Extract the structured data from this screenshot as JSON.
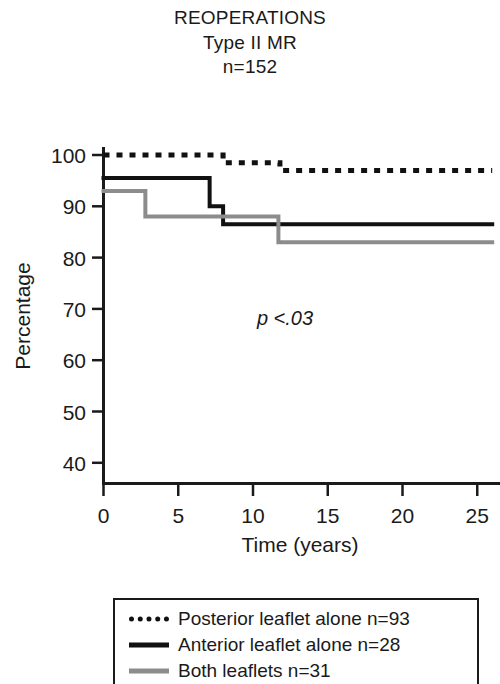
{
  "title": {
    "line1": "REOPERATIONS",
    "line2": "Type II MR",
    "line3": "n=152"
  },
  "annotation": {
    "p_value": "p <.03"
  },
  "chart_data": {
    "type": "line",
    "title": "REOPERATIONS Type II MR n=152",
    "subtitle": "Type II MR",
    "sample_size": "n=152",
    "xlabel": "Time (years)",
    "ylabel": "Percentage",
    "xlim": [
      0,
      26
    ],
    "ylim": [
      35.5,
      100
    ],
    "xticks": [
      0,
      5,
      10,
      15,
      20,
      25
    ],
    "xtick_labels": [
      "0",
      "5",
      "10",
      "15",
      "20",
      "25"
    ],
    "yticks": [
      40,
      50,
      60,
      70,
      80,
      90,
      100
    ],
    "ytick_labels": [
      "40",
      "50",
      "60",
      "70",
      "80",
      "90",
      "100"
    ],
    "grid": false,
    "legend_position": "below",
    "annotations": [
      "p <.03"
    ],
    "curve_style": "step-post (Kaplan-Meier freedom from reoperation)",
    "series": [
      {
        "name": "Posterior leaflet alone n=93",
        "label": "Posterior leaflet alone",
        "n": 93,
        "style": "dotted",
        "color": "#111111",
        "x": [
          0,
          8.0,
          8.0,
          11.8,
          11.8,
          26
        ],
        "y": [
          100,
          100,
          98.5,
          98.5,
          97,
          97
        ],
        "steps": [
          {
            "time": 0,
            "percentage": 100
          },
          {
            "time": 8.0,
            "percentage": 98.5
          },
          {
            "time": 11.8,
            "percentage": 97
          },
          {
            "time": 26,
            "percentage": 97
          }
        ]
      },
      {
        "name": "Anterior leaflet alone n=28",
        "label": "Anterior leaflet alone",
        "n": 28,
        "style": "solid",
        "color": "#111111",
        "x": [
          0,
          7.1,
          7.1,
          8.0,
          8.0,
          26
        ],
        "y": [
          95.5,
          95.5,
          90,
          90,
          86.5,
          86.5
        ],
        "steps": [
          {
            "time": 0,
            "percentage": 95.5
          },
          {
            "time": 7.1,
            "percentage": 90
          },
          {
            "time": 8.0,
            "percentage": 86.5
          },
          {
            "time": 26,
            "percentage": 86.5
          }
        ]
      },
      {
        "name": "Both leaflets n=31",
        "label": "Both leaflets",
        "n": 31,
        "style": "solid",
        "color": "#8c8c8c",
        "x": [
          0,
          2.8,
          2.8,
          11.7,
          11.7,
          26
        ],
        "y": [
          93,
          93,
          88,
          88,
          83,
          83
        ],
        "steps": [
          {
            "time": 0,
            "percentage": 93
          },
          {
            "time": 2.8,
            "percentage": 88
          },
          {
            "time": 11.7,
            "percentage": 83
          },
          {
            "time": 26,
            "percentage": 83
          }
        ]
      }
    ]
  },
  "legend": {
    "items": [
      {
        "label": "Posterior leaflet alone n=93",
        "style": "dotted",
        "color": "#111111"
      },
      {
        "label": "Anterior leaflet alone n=28",
        "style": "solid",
        "color": "#111111"
      },
      {
        "label": "Both leaflets n=31",
        "style": "solid-gray",
        "color": "#8c8c8c"
      }
    ]
  }
}
